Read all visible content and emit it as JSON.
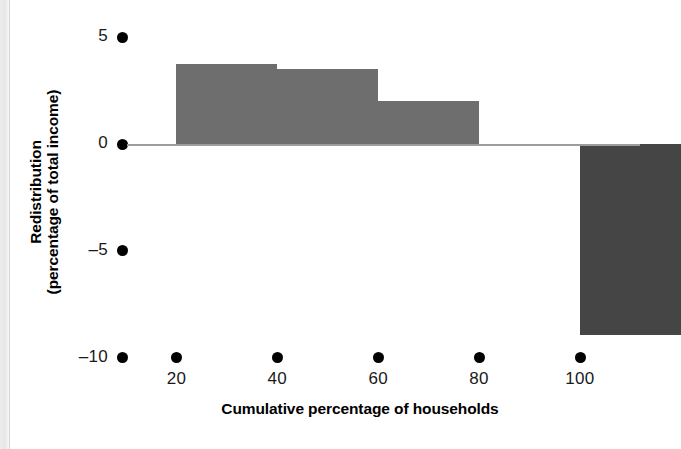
{
  "chart_data": {
    "type": "bar",
    "title": "",
    "xlabel": "Cumulative percentage of households",
    "ylabel_line1": "Redistribution",
    "ylabel_line2": "(percentage of total income)",
    "categories": [
      "20",
      "40",
      "60",
      "80",
      "100"
    ],
    "values": [
      3.75,
      3.5,
      2.0,
      -0.1,
      -8.95
    ],
    "x_tick_labels": [
      "20",
      "40",
      "60",
      "80",
      "100"
    ],
    "x_tick_values": [
      20,
      40,
      60,
      80,
      100
    ],
    "y_tick_labels": [
      "5",
      "0",
      "–5",
      "–10"
    ],
    "y_tick_values": [
      5,
      0,
      -5,
      -10
    ],
    "xlim": [
      10,
      110
    ],
    "ylim": [
      -10.7,
      5.6
    ],
    "grid": false,
    "legend": "none",
    "bar_color": "#6e6e6e",
    "last_bar_color": "#454545",
    "zero_line_color": "#9d9d9d",
    "bars": [
      {
        "label": "20",
        "value": 3.75,
        "x_left": 20,
        "x_right": 40,
        "color": "#6e6e6e"
      },
      {
        "label": "40",
        "value": 3.5,
        "x_left": 40,
        "x_right": 60,
        "color": "#6e6e6e"
      },
      {
        "label": "60",
        "value": 2.0,
        "x_left": 60,
        "x_right": 80,
        "color": "#6e6e6e"
      },
      {
        "label": "80",
        "value": -0.1,
        "x_left": 80,
        "x_right": 100,
        "color": "#6e6e6e"
      },
      {
        "label": "100",
        "value": -8.95,
        "x_left": 100,
        "x_right": 120,
        "color": "#454545"
      }
    ]
  },
  "axes": {
    "y_title_line1": "Redistribution",
    "y_title_line2": "(percentage of total income)",
    "x_title": "Cumulative percentage of households",
    "y_ticks": [
      {
        "label": "5",
        "top": 36
      },
      {
        "label": "0",
        "top": 136
      },
      {
        "label": "–5",
        "top": 247
      },
      {
        "label": "–10",
        "top": 349
      }
    ],
    "x_ticks": [
      {
        "label": "20",
        "left": 176
      },
      {
        "label": "40",
        "left": 277
      },
      {
        "label": "60",
        "left": 378
      },
      {
        "label": "80",
        "left": 479
      },
      {
        "label": "100",
        "left": 580
      }
    ]
  }
}
